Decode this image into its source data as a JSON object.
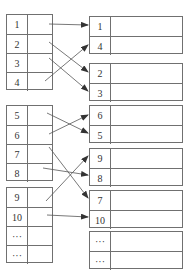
{
  "left_blocks": [
    {
      "rows": [
        "1",
        "2",
        "3",
        "4"
      ]
    },
    {
      "rows": [
        "5",
        "6",
        "7",
        "8"
      ]
    },
    {
      "rows": [
        "9",
        "10",
        "···",
        "···"
      ]
    }
  ],
  "right_blocks": [
    {
      "rows": [
        "1",
        "4"
      ]
    },
    {
      "rows": [
        "2",
        "3"
      ]
    },
    {
      "rows": [
        "6",
        "5"
      ]
    },
    {
      "rows": [
        "9",
        "8"
      ]
    },
    {
      "rows": [
        "7",
        "10"
      ]
    },
    {
      "rows": [
        "···",
        "···"
      ]
    }
  ],
  "arrows": [
    {
      "from": "1",
      "to": "1"
    },
    {
      "from": "2",
      "to": "2"
    },
    {
      "from": "3",
      "to": "3"
    },
    {
      "from": "4",
      "to": "4"
    },
    {
      "from": "5",
      "to": "5"
    },
    {
      "from": "6",
      "to": "6"
    },
    {
      "from": "7",
      "to": "7"
    },
    {
      "from": "8",
      "to": "8"
    },
    {
      "from": "9",
      "to": "9"
    },
    {
      "from": "10",
      "to": "10"
    }
  ],
  "colors": {
    "line": "#707070",
    "arrow": "#333333",
    "text": "#333333"
  }
}
